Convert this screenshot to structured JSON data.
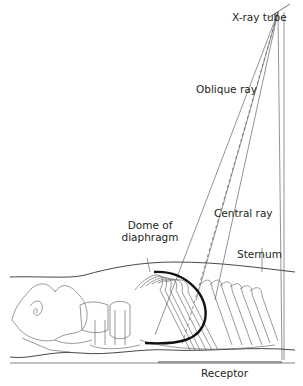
{
  "figure": {
    "type": "radiographic positioning diagram",
    "labels": {
      "xray_tube": "X-ray tube",
      "oblique_ray": "Oblique ray",
      "central_ray": "Central ray",
      "dome_of_diaphragm_line1": "Dome of",
      "dome_of_diaphragm_line2": "diaphragm",
      "sternum": "Sternum",
      "receptor": "Receptor"
    },
    "colors": {
      "line": "#4a4a4a",
      "dome": "#111111",
      "receptor": "#9a9a9a",
      "text": "#231f20"
    }
  }
}
